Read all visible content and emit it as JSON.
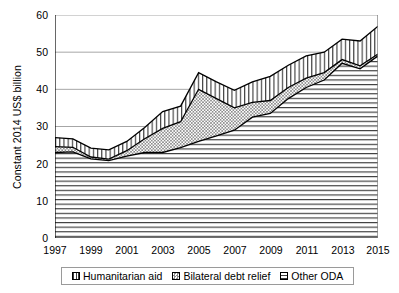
{
  "chart_data": {
    "type": "area",
    "stacked": true,
    "title": "",
    "subtitle": "",
    "xlabel": "",
    "ylabel": "Constant 2014 US$ billion",
    "xlim": [
      1997,
      2015
    ],
    "ylim": [
      0,
      60
    ],
    "ytick_values": [
      0,
      10,
      20,
      30,
      40,
      50,
      60
    ],
    "ytick_labels": [
      "0",
      "10",
      "20",
      "30",
      "40",
      "50",
      "60"
    ],
    "xtick_values": [
      1997,
      1999,
      2001,
      2003,
      2005,
      2007,
      2009,
      2011,
      2013,
      2015
    ],
    "xtick_labels": [
      "1997",
      "1999",
      "2001",
      "2003",
      "2005",
      "2007",
      "2009",
      "2011",
      "2013",
      "2015"
    ],
    "xtick_minor_values": [
      1998,
      2000,
      2002,
      2004,
      2006,
      2008,
      2010,
      2012,
      2014
    ],
    "grid": "horizontal",
    "legend_position": "bottom",
    "x": [
      1997,
      1998,
      1999,
      2000,
      2001,
      2002,
      2003,
      2004,
      2005,
      2006,
      2007,
      2008,
      2009,
      2010,
      2011,
      2012,
      2013,
      2014,
      2015
    ],
    "series": [
      {
        "name": "Other ODA",
        "fill": "horizontal-lines",
        "values": [
          23.0,
          23.2,
          21.3,
          20.8,
          22.0,
          23.0,
          23.0,
          24.3,
          26.0,
          27.5,
          29.0,
          32.5,
          33.5,
          37.5,
          40.5,
          42.5,
          47.0,
          45.5,
          49.0
        ]
      },
      {
        "name": "Bilateral debt relief",
        "fill": "checker-dots",
        "values": [
          1.6,
          1.2,
          0.5,
          0.4,
          1.5,
          3.7,
          6.5,
          7.0,
          14.0,
          10.0,
          6.0,
          4.0,
          3.5,
          3.0,
          2.5,
          2.0,
          1.0,
          0.8,
          0.5
        ]
      },
      {
        "name": "Humanitarian aid",
        "fill": "vertical-lines",
        "values": [
          2.4,
          2.3,
          2.4,
          2.5,
          2.5,
          3.0,
          4.5,
          4.2,
          4.5,
          4.5,
          4.7,
          5.5,
          6.5,
          6.0,
          6.0,
          5.5,
          5.5,
          6.7,
          7.5
        ]
      }
    ],
    "totals": [
      27.0,
      26.7,
      24.2,
      23.7,
      26.0,
      29.7,
      34.0,
      35.5,
      44.5,
      42.0,
      39.7,
      42.0,
      43.5,
      46.5,
      49.0,
      50.0,
      53.5,
      53.0,
      57.0
    ]
  },
  "legend": {
    "items": [
      {
        "label": "Humanitarian aid",
        "swatch": "vertical-lines-swatch"
      },
      {
        "label": "Bilateral debt relief",
        "swatch": "checker-dots-swatch"
      },
      {
        "label": "Other ODA",
        "swatch": "horizontal-lines-swatch"
      }
    ]
  },
  "colors": {
    "axis": "#000000",
    "grid": "#a6a6a6",
    "plot_background": "#ffffff",
    "series_outline": "#000000",
    "legend_border": "#9a9a9a"
  }
}
